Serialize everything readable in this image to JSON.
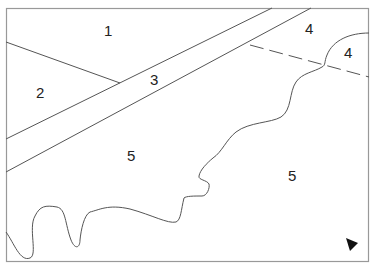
{
  "diagram": {
    "type": "zoning-map",
    "regions": [
      {
        "id": "1",
        "label": "1",
        "x": 109,
        "y": 36
      },
      {
        "id": "2",
        "label": "2",
        "x": 41,
        "y": 98
      },
      {
        "id": "3",
        "label": "3",
        "x": 155,
        "y": 85
      },
      {
        "id": "4a",
        "label": "4",
        "x": 310,
        "y": 33
      },
      {
        "id": "4b",
        "label": "4",
        "x": 132,
        "y": 160
      },
      {
        "id": "5a",
        "label": "5",
        "x": 349,
        "y": 57
      },
      {
        "id": "5b",
        "label": "5",
        "x": 293,
        "y": 181
      }
    ],
    "north_arrow": "triangle-marker",
    "colors": {
      "line": "#555555",
      "border": "#888888",
      "text": "#222222",
      "marker": "#111111"
    }
  }
}
